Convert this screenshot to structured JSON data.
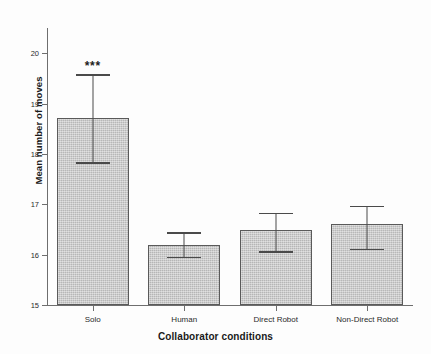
{
  "chart_data": {
    "type": "bar",
    "title": "",
    "xlabel": "Collaborator conditions",
    "ylabel": "Mean number of moves",
    "categories": [
      "Solo",
      "Human",
      "Direct Robot",
      "Non-Direct Robot"
    ],
    "values": [
      18.72,
      16.19,
      16.48,
      16.6
    ],
    "errors_upper": [
      19.58,
      16.44,
      16.83,
      16.97
    ],
    "errors_lower": [
      17.84,
      15.96,
      16.07,
      16.12
    ],
    "annotations": [
      {
        "category": "Solo",
        "text": "***"
      }
    ],
    "ylim": [
      15,
      20.5
    ],
    "yticks": [
      15,
      16,
      17,
      18,
      19,
      20
    ],
    "ytick_labels": [
      "15",
      "16",
      "17",
      "18",
      "19",
      "20"
    ],
    "grid": false,
    "legend": "none",
    "bar_fill_color": "#c6c6c6",
    "bar_edge_color": "#5a5a5a",
    "axis_color": "#6e6e6e",
    "error_bar_color": "#4a4a4a"
  }
}
